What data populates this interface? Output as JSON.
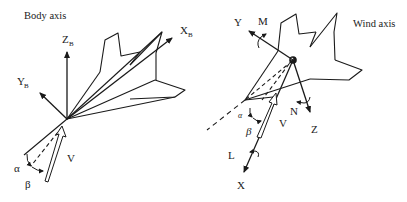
{
  "diagram": {
    "type": "aircraft-axis-systems",
    "panels": [
      {
        "id": "body",
        "title": "Body axis",
        "axes": [
          {
            "name": "x",
            "label": "X",
            "subscript": "B"
          },
          {
            "name": "y",
            "label": "Y",
            "subscript": "B"
          },
          {
            "name": "z",
            "label": "Z",
            "subscript": "B"
          }
        ],
        "velocity_label": "V",
        "angles": [
          {
            "name": "angle-of-attack",
            "label": "α"
          },
          {
            "name": "sideslip",
            "label": "β"
          }
        ]
      },
      {
        "id": "wind",
        "title": "Wind axis",
        "axes": [
          {
            "name": "x",
            "label": "X",
            "moment": "L"
          },
          {
            "name": "y",
            "label": "Y",
            "moment": "M"
          },
          {
            "name": "z",
            "label": "Z",
            "moment": "N"
          }
        ],
        "velocity_label": "V",
        "angles": [
          {
            "name": "angle-of-attack",
            "label": "α"
          },
          {
            "name": "sideslip",
            "label": "β"
          }
        ]
      }
    ],
    "colors": {
      "stroke": "#1a1a1a",
      "background": "#ffffff"
    }
  }
}
